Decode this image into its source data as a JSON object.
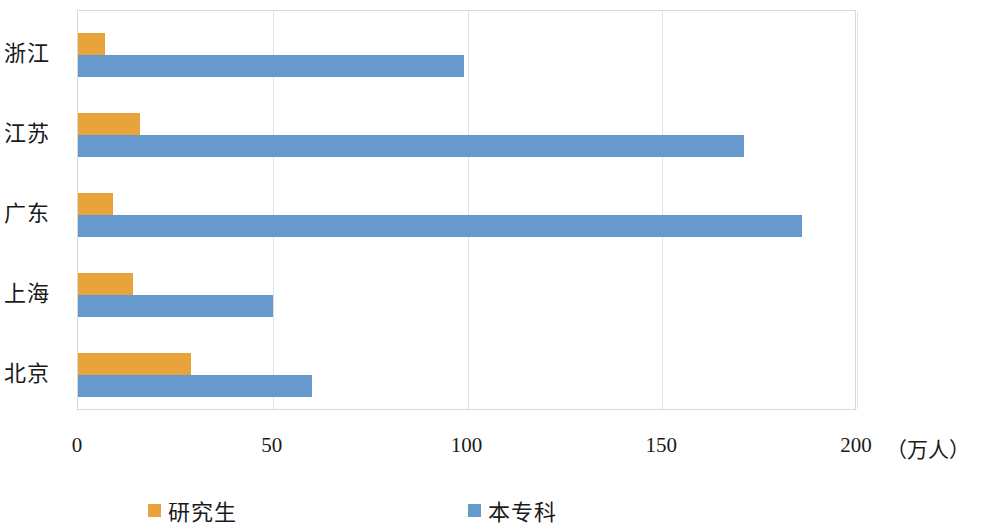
{
  "chart_data": {
    "type": "bar",
    "orientation": "horizontal",
    "title": "",
    "subtitle": "",
    "xlabel": "",
    "ylabel": "",
    "unit_label": "（万人）",
    "categories": [
      "浙江",
      "江苏",
      "广东",
      "上海",
      "北京"
    ],
    "series": [
      {
        "name": "研究生",
        "color": "#e8a33d",
        "values": [
          7,
          16,
          9,
          14,
          29
        ]
      },
      {
        "name": "本专科",
        "color": "#6699cc",
        "values": [
          99,
          171,
          186,
          50,
          60
        ]
      }
    ],
    "xlim": [
      0,
      200
    ],
    "xticks": [
      0,
      50,
      100,
      150,
      200
    ],
    "xtick_labels": [
      "0",
      "50",
      "100",
      "150",
      "200"
    ],
    "grid": true,
    "grid_axis": "x",
    "legend_position": "bottom",
    "legend_entries": [
      "研究生",
      "本专科"
    ]
  },
  "legend": {
    "graduate_label": "研究生",
    "undergraduate_label": "本专科",
    "graduate_color": "#e8a33d",
    "undergraduate_color": "#6699cc"
  },
  "axis": {
    "unit": "（万人）"
  }
}
